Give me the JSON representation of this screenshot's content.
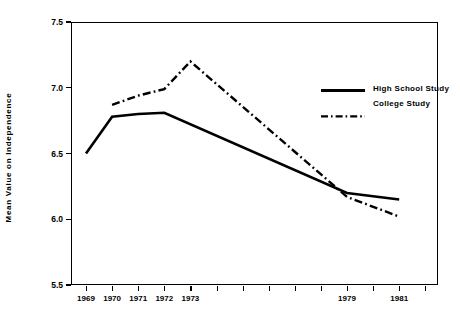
{
  "chart_data": {
    "type": "line",
    "title": "",
    "xlabel": "",
    "ylabel": "Mean Value on Independence",
    "ylim": [
      5.5,
      7.5
    ],
    "yticks": [
      "5.5",
      "6.0",
      "6.5",
      "7.0",
      "7.5"
    ],
    "ytick_values": [
      5.5,
      6.0,
      6.5,
      7.0,
      7.5
    ],
    "xlim": [
      1969,
      1982
    ],
    "x": [
      1969,
      1970,
      1971,
      1972,
      1973,
      1974,
      1975,
      1976,
      1977,
      1978,
      1979,
      1980,
      1981
    ],
    "xticks": [
      1969,
      1970,
      1971,
      1972,
      1973,
      1974,
      1975,
      1976,
      1977,
      1978,
      1979,
      1980,
      1981
    ],
    "xtick_labels": [
      "1969",
      "1970",
      "1971",
      "1972",
      "1973",
      "",
      "",
      "",
      "",
      "",
      "1979",
      "",
      "1981"
    ],
    "grid": false,
    "legend_position": "upper-right",
    "series": [
      {
        "name": "High School Study",
        "style": "solid",
        "color": "#000000",
        "x": [
          1969,
          1970,
          1971,
          1972,
          1979,
          1981
        ],
        "values": [
          6.5,
          6.78,
          6.8,
          6.81,
          6.2,
          6.15
        ]
      },
      {
        "name": "College Study",
        "style": "dash-dot",
        "color": "#000000",
        "x": [
          1970,
          1971,
          1972,
          1973,
          1979,
          1981
        ],
        "values": [
          6.87,
          6.94,
          6.99,
          7.2,
          6.17,
          6.02
        ]
      }
    ]
  },
  "legend": {
    "entries": [
      {
        "label": "High School Study",
        "style": "solid"
      },
      {
        "label": "College Study",
        "style": "dash-dot"
      }
    ]
  }
}
